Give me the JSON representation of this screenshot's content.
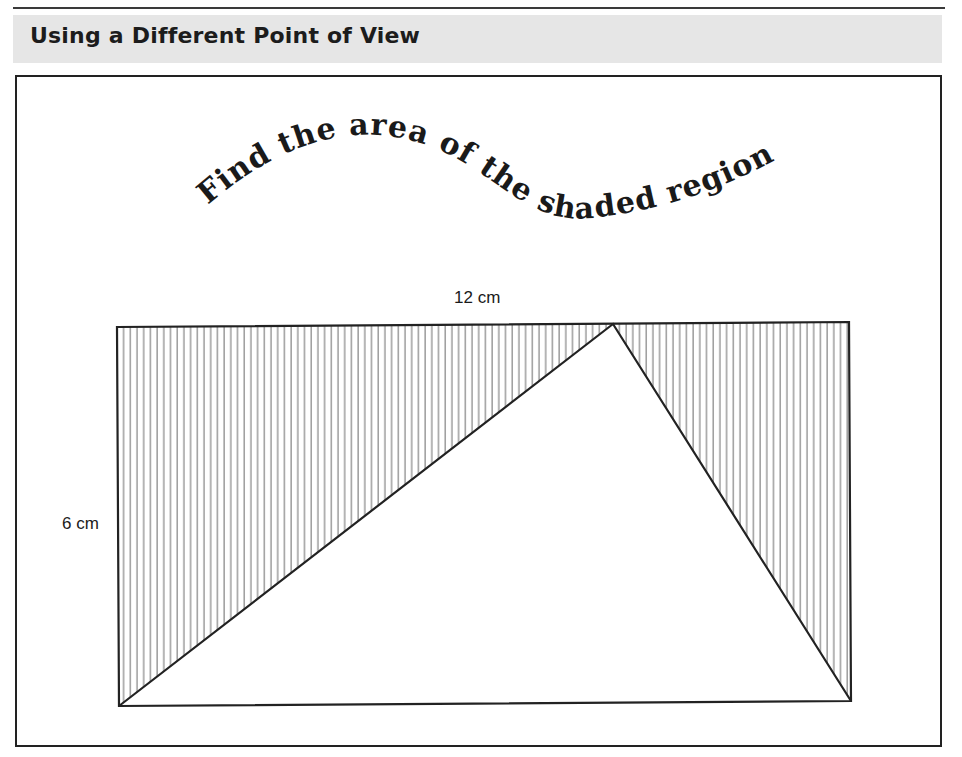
{
  "header": {
    "section_title": "Using a Different Point of View",
    "band_color": "#e6e6e6"
  },
  "problem": {
    "prompt": "Find the area of the shaded region:",
    "width_label": "12 cm",
    "height_label": "6 cm"
  },
  "figure": {
    "rectangle": {
      "width_cm": 12,
      "height_cm": 6
    },
    "triangle": {
      "vertices": [
        "bottom-left corner",
        "point on top edge",
        "bottom-right corner"
      ],
      "base": "bottom edge of rectangle",
      "apex_on": "top edge"
    },
    "shading": "vertical hatch lines in the two regions outside the triangle",
    "line_color": "#222222",
    "hatch_color": "#777777"
  }
}
